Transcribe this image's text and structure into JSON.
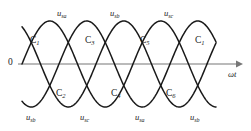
{
  "figure": {
    "origin_label": "0",
    "axis_label": "ωt"
  },
  "wave_labels_top": [
    {
      "name": "u",
      "sub": "sa",
      "x": 57,
      "y": 9
    },
    {
      "name": "u",
      "sub": "sb",
      "x": 110,
      "y": 9
    },
    {
      "name": "u",
      "sub": "sc",
      "x": 164,
      "y": 9
    }
  ],
  "wave_labels_bottom": [
    {
      "name": "u",
      "sub": "sb",
      "x": 26,
      "y": 113
    },
    {
      "name": "u",
      "sub": "sc",
      "x": 80,
      "y": 113
    },
    {
      "name": "u",
      "sub": "sa",
      "x": 135,
      "y": 113
    },
    {
      "name": "u",
      "sub": "sb",
      "x": 190,
      "y": 113
    }
  ],
  "crossing_labels": [
    {
      "name": "C",
      "sub": "1",
      "x": 30,
      "y": 36
    },
    {
      "name": "C",
      "sub": "3",
      "x": 85,
      "y": 36
    },
    {
      "name": "C",
      "sub": "5",
      "x": 140,
      "y": 36
    },
    {
      "name": "C",
      "sub": "1",
      "x": 195,
      "y": 36
    },
    {
      "name": "C",
      "sub": "2",
      "x": 56,
      "y": 89
    },
    {
      "name": "C",
      "sub": "4",
      "x": 111,
      "y": 89
    },
    {
      "name": "C",
      "sub": "6",
      "x": 166,
      "y": 89
    }
  ],
  "chart_data": {
    "type": "line",
    "title": "",
    "xlabel": "ωt",
    "ylabel": "",
    "grid": false,
    "legend": "inline-curve-labels",
    "baseline_y": 64,
    "amplitude_px": 43,
    "period_px": 111,
    "x_start": 22,
    "x_end": 216,
    "axis_x_start": 18,
    "axis_x_end": 240,
    "series": [
      {
        "name": "u_sa",
        "phase_deg": 0,
        "color": "#1a1a1a"
      },
      {
        "name": "u_sb",
        "phase_deg": -120,
        "color": "#1a1a1a"
      },
      {
        "name": "u_sc",
        "phase_deg": -240,
        "color": "#1a1a1a"
      }
    ],
    "crossings": [
      {
        "label": "C1",
        "x": 32,
        "y": 43
      },
      {
        "label": "C2",
        "x": 60,
        "y": 86
      },
      {
        "label": "C3",
        "x": 88,
        "y": 43
      },
      {
        "label": "C4",
        "x": 116,
        "y": 86
      },
      {
        "label": "C5",
        "x": 143,
        "y": 43
      },
      {
        "label": "C6",
        "x": 171,
        "y": 86
      },
      {
        "label": "C1",
        "x": 198,
        "y": 43
      }
    ],
    "colors": {
      "curve": "#1a1a1a",
      "axis": "#777777",
      "text": "#1a1a1a"
    }
  }
}
